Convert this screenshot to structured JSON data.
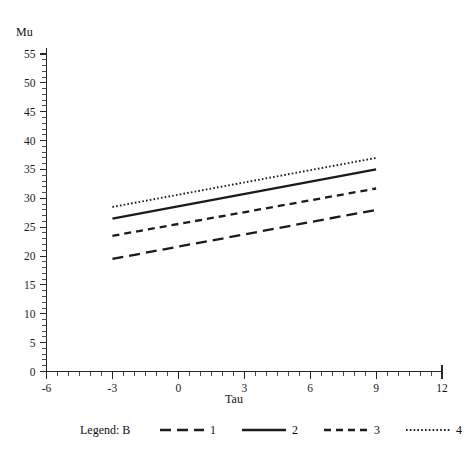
{
  "chart_data": {
    "type": "line",
    "title": "",
    "xlabel": "Tau",
    "ylabel": "Mu",
    "xlim": [
      -6,
      12
    ],
    "ylim": [
      0,
      55
    ],
    "x_ticks": [
      -6,
      -3,
      0,
      3,
      6,
      9,
      12
    ],
    "y_ticks": [
      0,
      5,
      10,
      15,
      20,
      25,
      30,
      35,
      40,
      45,
      50,
      55
    ],
    "x_minor_step": 0.5,
    "y_minor_step": 1,
    "grid": false,
    "legend_position": "below",
    "legend_title": "Legend: B",
    "x": [
      -3,
      9
    ],
    "series": [
      {
        "name": "1",
        "style": "long-dash",
        "values": [
          19.5,
          28.0
        ]
      },
      {
        "name": "2",
        "style": "solid",
        "values": [
          26.5,
          35.0
        ]
      },
      {
        "name": "3",
        "style": "short-dash",
        "values": [
          23.5,
          31.7
        ]
      },
      {
        "name": "4",
        "style": "dotted",
        "values": [
          28.5,
          37.0
        ]
      }
    ]
  },
  "axes": {
    "y_title": "Mu",
    "x_title": "Tau",
    "y_tick_labels": [
      "0",
      "5",
      "10",
      "15",
      "20",
      "25",
      "30",
      "35",
      "40",
      "45",
      "50",
      "55"
    ],
    "x_tick_labels": [
      "-6",
      "-3",
      "0",
      "3",
      "6",
      "9",
      "12"
    ]
  },
  "legend": {
    "title": "Legend: B",
    "entries": [
      {
        "label": "1",
        "style": "long-dash"
      },
      {
        "label": "2",
        "style": "solid"
      },
      {
        "label": "3",
        "style": "short-dash"
      },
      {
        "label": "4",
        "style": "dotted"
      }
    ]
  },
  "colors": {
    "ink": "#1b1b1b",
    "background": "#ffffff"
  }
}
